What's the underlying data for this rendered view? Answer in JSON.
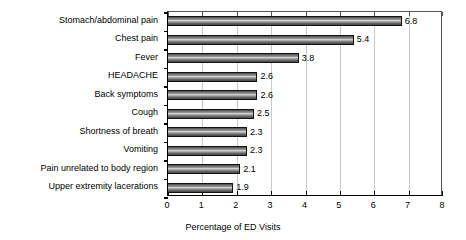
{
  "chart_data": {
    "type": "bar",
    "orientation": "horizontal",
    "title": "",
    "subtitle": "",
    "xlabel": "Percentage of ED Visits",
    "ylabel": "",
    "categories": [
      "Stomach/abdominal pain",
      "Chest pain",
      "Fever",
      "HEADACHE",
      "Back symptoms",
      "Cough",
      "Shortness of breath",
      "Vomiting",
      "Pain unrelated to body region",
      "Upper extremity lacerations"
    ],
    "values": [
      6.8,
      5.4,
      3.8,
      2.6,
      2.6,
      2.5,
      2.3,
      2.3,
      2.1,
      1.9
    ],
    "data_labels": [
      "6.8",
      "5.4",
      "3.8",
      "2.6",
      "2.6",
      "2.5",
      "2.3",
      "2.3",
      "2.1",
      "1.9"
    ],
    "xlim": [
      0,
      8
    ],
    "xticks": [
      0,
      1,
      2,
      3,
      4,
      5,
      6,
      7,
      8
    ],
    "xtick_labels": [
      "0",
      "1",
      "2",
      "3",
      "4",
      "5",
      "6",
      "7",
      "8"
    ],
    "grid": "vertical",
    "legend": "none",
    "bar_color": "#6e6e6e",
    "bar_edge_color": "#111111",
    "gridline_color": "#c9c9c9",
    "axis_color": "#000000",
    "background": "#ffffff"
  }
}
